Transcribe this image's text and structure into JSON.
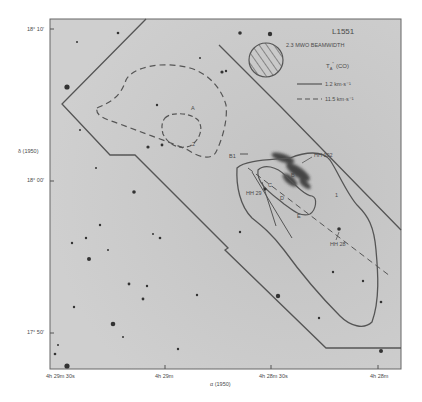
{
  "figure": {
    "title": "L1551",
    "beam_label": "2.3 MWO BEAMWIDTH",
    "quantity_label": "T",
    "quantity_sub": "A",
    "quantity_sup": "*",
    "quantity_suffix": "(CO)",
    "legend": [
      {
        "style": "solid",
        "label": "1.2  km·s⁻¹"
      },
      {
        "style": "dashed",
        "label": "11.5  km·s⁻¹"
      }
    ],
    "y_axis": {
      "label": "δ (1950)",
      "ticks": [
        "18° 10′",
        "18° 00′",
        "17° 50′"
      ]
    },
    "x_axis": {
      "label": "α (1950)",
      "ticks": [
        "4h 29m 30s",
        "4h 29m",
        "4h 28m 30s",
        "4h 28m"
      ]
    },
    "objects": [
      {
        "name": "HH 102"
      },
      {
        "name": "HH 29"
      },
      {
        "name": "HH 28"
      },
      {
        "name": "B1"
      }
    ],
    "contour_letters": [
      "A",
      "2",
      "B",
      "C",
      "D",
      "E",
      "1"
    ],
    "colors": {
      "background": "#ffffff",
      "plate": "#c9c9c9",
      "lines": "#505050",
      "text": "#4a4a4a",
      "nebula": "#2e2e2e"
    }
  }
}
